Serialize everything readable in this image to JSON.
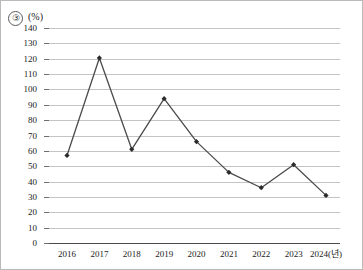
{
  "figure": {
    "item_number": "③",
    "unit_label": "(%)"
  },
  "chart_data": {
    "type": "line",
    "title": "",
    "xlabel": "2024(년)",
    "ylabel": "(%)",
    "categories": [
      "2016",
      "2017",
      "2018",
      "2019",
      "2020",
      "2021",
      "2022",
      "2023",
      "2024(년)"
    ],
    "values": [
      57,
      120.5,
      61,
      94,
      66,
      46,
      36,
      51,
      31
    ],
    "series": [
      {
        "name": "",
        "values": [
          57,
          120.5,
          61,
          94,
          66,
          46,
          36,
          51,
          31
        ]
      }
    ],
    "ylim": [
      0,
      140
    ],
    "ytick_step": 10,
    "yticks": [
      0,
      10,
      20,
      30,
      40,
      50,
      60,
      70,
      80,
      90,
      100,
      110,
      120,
      130,
      140
    ],
    "ytick_labels": [
      "0",
      "10",
      "20",
      "30",
      "40",
      "50",
      "60",
      "70",
      "80",
      "90",
      "100",
      "110",
      "120",
      "130",
      "140"
    ],
    "grid": true,
    "legend": false,
    "legend_position": "none",
    "marker": "diamond",
    "line_color": "#4a4a4a",
    "marker_color": "#2b2b2b",
    "grid_color": "#c4c4c4",
    "axis_color": "#4a4a4a"
  }
}
